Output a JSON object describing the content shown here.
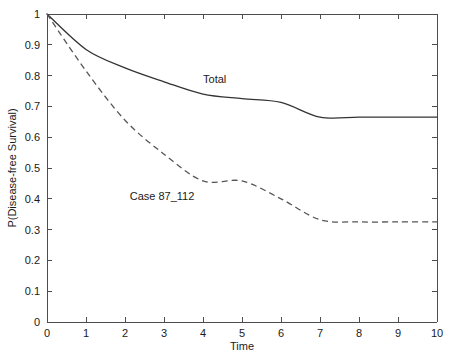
{
  "chart_data": {
    "type": "line",
    "title": "",
    "xlabel": "Time",
    "ylabel": "P(Disease-free Survival)",
    "xlim": [
      0,
      10
    ],
    "ylim": [
      0,
      1
    ],
    "grid": false,
    "legend_position": "inline-annotation",
    "x": [
      0,
      1,
      2,
      3,
      4,
      5,
      6,
      7,
      8,
      9,
      10
    ],
    "xticks": [
      "0",
      "1",
      "2",
      "3",
      "4",
      "5",
      "6",
      "7",
      "8",
      "9",
      "10"
    ],
    "yticks": [
      "0",
      "0.1",
      "0.2",
      "0.3",
      "0.4",
      "0.5",
      "0.6",
      "0.7",
      "0.8",
      "0.9",
      "1"
    ],
    "series": [
      {
        "name": "Total",
        "style": "solid",
        "color": "#333333",
        "annotation": "Total",
        "annotation_x": 4.3,
        "annotation_y": 0.775,
        "values": [
          1.0,
          0.885,
          0.825,
          0.78,
          0.74,
          0.725,
          0.713,
          0.665,
          0.665,
          0.665,
          0.665
        ]
      },
      {
        "name": "Case 87_112",
        "style": "dashed",
        "color": "#555555",
        "annotation": "Case 87_112",
        "annotation_x": 2.95,
        "annotation_y": 0.395,
        "values": [
          1.0,
          0.815,
          0.655,
          0.545,
          0.458,
          0.458,
          0.4,
          0.332,
          0.325,
          0.325,
          0.325
        ]
      }
    ]
  },
  "axes": {
    "x_label": "Time",
    "y_label": "P(Disease-free Survival)"
  }
}
